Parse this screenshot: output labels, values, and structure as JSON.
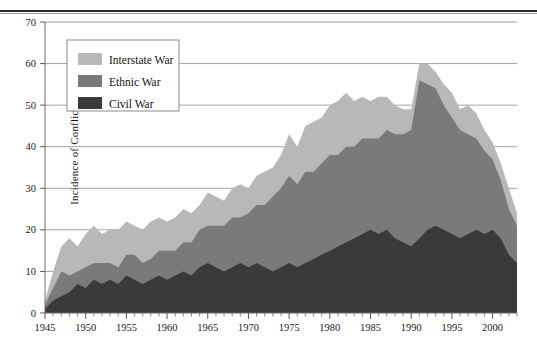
{
  "figure": {
    "has_top_rule": true,
    "background_color": "#ffffff"
  },
  "chart_data": {
    "type": "area",
    "stacked": true,
    "title": "",
    "xlabel": "",
    "ylabel": "Incidence of Conflict",
    "xlim": [
      1945,
      2003
    ],
    "ylim": [
      0,
      70
    ],
    "ytick_step": 10,
    "xtick_major_step": 5,
    "xtick_minor_step": 1,
    "grid": "horizontal",
    "legend_position": "upper-left-inside",
    "ytick_labels": [
      "0",
      "10",
      "20",
      "30",
      "40",
      "50",
      "60",
      "70"
    ],
    "ytick_values": [
      0,
      10,
      20,
      30,
      40,
      50,
      60,
      70
    ],
    "xtick_labels": [
      "1945",
      "1950",
      "1955",
      "1960",
      "1965",
      "1970",
      "1975",
      "1980",
      "1985",
      "1990",
      "1995",
      "2000"
    ],
    "xtick_values": [
      1945,
      1950,
      1955,
      1960,
      1965,
      1970,
      1975,
      1980,
      1985,
      1990,
      1995,
      2000
    ],
    "x": [
      1945,
      1946,
      1947,
      1948,
      1949,
      1950,
      1951,
      1952,
      1953,
      1954,
      1955,
      1956,
      1957,
      1958,
      1959,
      1960,
      1961,
      1962,
      1963,
      1964,
      1965,
      1966,
      1967,
      1968,
      1969,
      1970,
      1971,
      1972,
      1973,
      1974,
      1975,
      1976,
      1977,
      1978,
      1979,
      1980,
      1981,
      1982,
      1983,
      1984,
      1985,
      1986,
      1987,
      1988,
      1989,
      1990,
      1991,
      1992,
      1993,
      1994,
      1995,
      1996,
      1997,
      1998,
      1999,
      2000,
      2001,
      2002,
      2003
    ],
    "series": [
      {
        "name": "Civil War",
        "color": "#3a3a3a",
        "stack_order": 1,
        "values": [
          1,
          3,
          4,
          5,
          7,
          6,
          8,
          7,
          8,
          7,
          9,
          8,
          7,
          8,
          9,
          8,
          9,
          10,
          9,
          11,
          12,
          11,
          10,
          11,
          12,
          11,
          12,
          11,
          10,
          11,
          12,
          11,
          12,
          13,
          14,
          15,
          16,
          17,
          18,
          19,
          20,
          19,
          20,
          18,
          17,
          16,
          18,
          20,
          21,
          20,
          19,
          18,
          19,
          20,
          19,
          20,
          18,
          14,
          12
        ]
      },
      {
        "name": "Ethnic War",
        "color": "#7a7a7a",
        "stack_order": 2,
        "values": [
          1,
          3,
          6,
          4,
          3,
          5,
          4,
          5,
          4,
          4,
          5,
          6,
          5,
          5,
          6,
          7,
          6,
          7,
          8,
          9,
          9,
          10,
          11,
          12,
          11,
          13,
          14,
          15,
          18,
          19,
          21,
          20,
          22,
          21,
          22,
          23,
          22,
          23,
          22,
          23,
          22,
          23,
          24,
          25,
          26,
          28,
          38,
          35,
          33,
          30,
          28,
          26,
          24,
          22,
          20,
          17,
          14,
          11,
          9
        ]
      },
      {
        "name": "Interstate War",
        "color": "#b8b8b8",
        "stack_order": 3,
        "values": [
          1,
          4,
          6,
          9,
          6,
          8,
          9,
          7,
          8,
          9,
          8,
          7,
          8,
          9,
          8,
          7,
          8,
          8,
          7,
          6,
          8,
          7,
          6,
          7,
          8,
          6,
          7,
          8,
          7,
          8,
          10,
          9,
          11,
          12,
          11,
          12,
          13,
          13,
          11,
          10,
          9,
          10,
          8,
          7,
          6,
          5,
          4,
          5,
          4,
          5,
          6,
          5,
          7,
          6,
          5,
          4,
          4,
          5,
          3
        ]
      }
    ]
  },
  "legend": {
    "items": [
      {
        "label": "Interstate War",
        "color": "#b8b8b8"
      },
      {
        "label": "Ethnic War",
        "color": "#7a7a7a"
      },
      {
        "label": "Civil War",
        "color": "#3a3a3a"
      }
    ]
  }
}
